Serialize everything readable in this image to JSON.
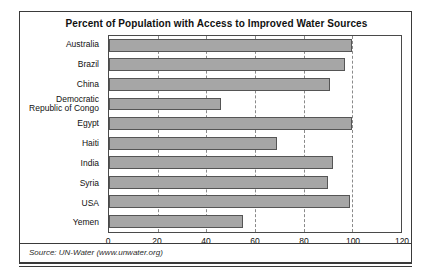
{
  "chart_data": {
    "type": "bar",
    "orientation": "horizontal",
    "title": "Percent of Population with Access to Improved Water Sources",
    "xlabel": "",
    "ylabel": "",
    "xlim": [
      0,
      120
    ],
    "xticks": [
      0,
      20,
      40,
      60,
      80,
      100,
      120
    ],
    "grid": true,
    "legend": false,
    "bar_color": "#a6a6a6",
    "bar_edge_color": "#555555",
    "categories": [
      "Australia",
      "Brazil",
      "China",
      "Democratic\nRepublic of Congo",
      "Egypt",
      "Haiti",
      "India",
      "Syria",
      "USA",
      "Yemen"
    ],
    "values": [
      100,
      97,
      91,
      46,
      100,
      69,
      92,
      90,
      99,
      55
    ],
    "annotations": []
  },
  "source": {
    "text": "Source: UN-Water (www.unwater.org)"
  }
}
